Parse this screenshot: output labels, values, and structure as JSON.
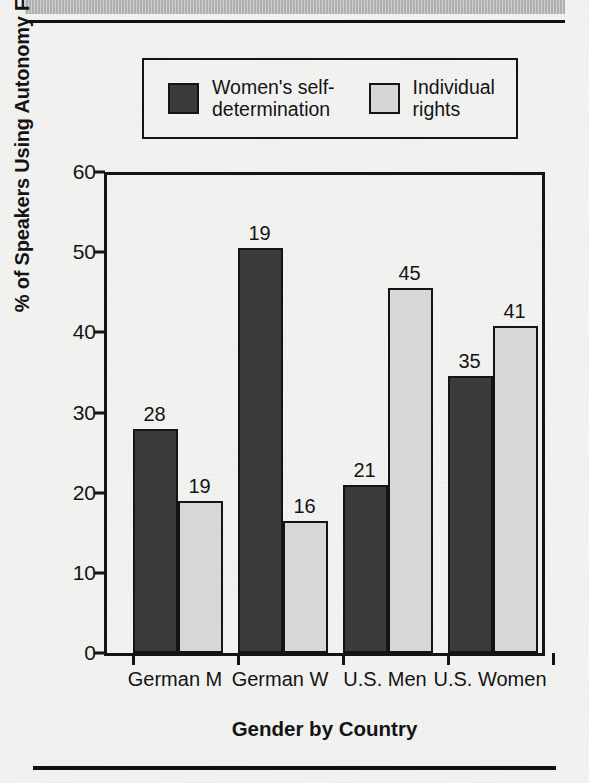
{
  "page": {
    "background_color": "#f2f2f1",
    "rule_color": "#111111",
    "header_band_color": "#b9b9b7",
    "header_clipped_text": "p y p"
  },
  "legend": {
    "entries": [
      {
        "label": "Women's self-\ndetermination",
        "swatch": "dark-swatch",
        "color": "#3b3b3b"
      },
      {
        "label": "Individual\nrights",
        "swatch": "light-swatch",
        "color": "#d7d7d7"
      }
    ]
  },
  "chart_data": {
    "type": "bar",
    "title": "",
    "xlabel": "Gender by Country",
    "ylabel": "% of Speakers Using Autonomy Frame",
    "categories": [
      "German M",
      "German W",
      "U.S. Men",
      "U.S. Women"
    ],
    "ylim": [
      0,
      60
    ],
    "yticks": [
      0,
      10,
      20,
      30,
      40,
      50,
      60
    ],
    "grid": false,
    "legend_position": "above-plot",
    "series": [
      {
        "name": "Women's self-determination",
        "color": "#3b3b3b",
        "values": [
          28.0,
          50.5,
          21.0,
          34.5
        ],
        "point_labels": [
          "28",
          "19",
          "21",
          "35"
        ]
      },
      {
        "name": "Individual rights",
        "color": "#d7d7d7",
        "values": [
          19.0,
          16.5,
          45.5,
          40.8
        ],
        "point_labels": [
          "19",
          "16",
          "45",
          "41"
        ]
      }
    ],
    "point_label_meaning": "number of speakers (n)"
  },
  "axes": {
    "y_tick_labels": [
      "60",
      "50",
      "40",
      "30",
      "20",
      "10",
      "0"
    ],
    "y_axis_title": "% of Speakers Using Autonomy Frame",
    "x_axis_title": "Gender by Country",
    "x_tick_labels": [
      "German M",
      "German W",
      "U.S. Men",
      "U.S. Women"
    ]
  }
}
